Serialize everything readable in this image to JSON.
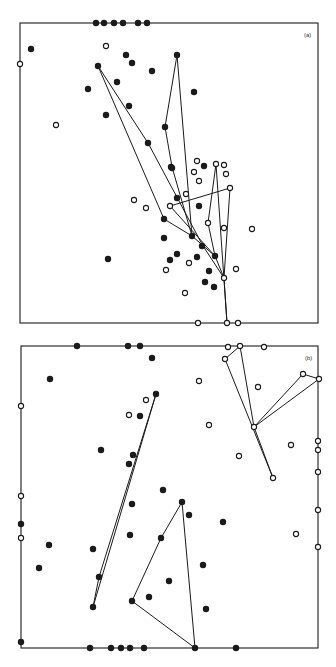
{
  "figure": {
    "width": 336,
    "height": 667,
    "stroke_color": "#1a1a1a",
    "point_radius": 3.2,
    "panels": [
      {
        "id": "a",
        "label": "(a)",
        "label_pos": [
          304,
          38
        ],
        "frame": {
          "x1": 20,
          "y1": 23,
          "x2": 318,
          "y2": 323
        },
        "filled_points": [
          [
            96,
            23
          ],
          [
            104,
            23
          ],
          [
            114,
            23
          ],
          [
            123,
            23
          ],
          [
            138,
            23
          ],
          [
            147,
            23
          ],
          [
            31,
            49
          ],
          [
            126,
            55
          ],
          [
            177,
            55
          ],
          [
            132,
            63
          ],
          [
            98,
            66
          ],
          [
            152,
            71
          ],
          [
            117,
            82
          ],
          [
            88,
            89
          ],
          [
            194,
            92
          ],
          [
            129,
            106
          ],
          [
            106,
            115
          ],
          [
            165,
            127
          ],
          [
            148,
            143
          ],
          [
            172,
            168
          ],
          [
            171,
            167
          ],
          [
            204,
            166
          ],
          [
            177,
            198
          ],
          [
            199,
            206
          ],
          [
            164,
            219
          ],
          [
            164,
            238
          ],
          [
            192,
            236
          ],
          [
            202,
            246
          ],
          [
            108,
            259
          ],
          [
            177,
            254
          ],
          [
            170,
            260
          ],
          [
            197,
            257
          ],
          [
            215,
            256
          ],
          [
            209,
            271
          ],
          [
            205,
            282
          ],
          [
            214,
            287
          ]
        ],
        "open_points": [
          [
            20,
            64
          ],
          [
            106,
            46
          ],
          [
            56,
            125
          ],
          [
            197,
            161
          ],
          [
            216,
            164
          ],
          [
            224,
            165
          ],
          [
            194,
            172
          ],
          [
            226,
            174
          ],
          [
            199,
            181
          ],
          [
            230,
            188
          ],
          [
            186,
            194
          ],
          [
            134,
            200
          ],
          [
            170,
            206
          ],
          [
            146,
            208
          ],
          [
            208,
            223
          ],
          [
            224,
            228
          ],
          [
            252,
            229
          ],
          [
            189,
            263
          ],
          [
            166,
            270
          ],
          [
            236,
            269
          ],
          [
            224,
            278
          ],
          [
            185,
            293
          ],
          [
            198,
            323
          ],
          [
            227,
            323
          ],
          [
            238,
            323
          ]
        ],
        "polylines": [
          [
            [
              98,
              66
            ],
            [
              164,
              219
            ],
            [
              192,
              236
            ],
            [
              215,
              256
            ],
            [
              224,
              278
            ]
          ],
          [
            [
              98,
              66
            ],
            [
              148,
              143
            ],
            [
              203,
              246
            ],
            [
              224,
              278
            ]
          ],
          [
            [
              177,
              55
            ],
            [
              165,
              127
            ],
            [
              172,
              167
            ],
            [
              192,
              236
            ]
          ],
          [
            [
              177,
              55
            ],
            [
              192,
              236
            ]
          ],
          [
            [
              170,
              206
            ],
            [
              230,
              188
            ],
            [
              224,
              278
            ],
            [
              227,
              323
            ]
          ],
          [
            [
              170,
              206
            ],
            [
              215,
              256
            ]
          ],
          [
            [
              216,
              164
            ],
            [
              208,
              223
            ],
            [
              215,
              256
            ]
          ],
          [
            [
              216,
              164
            ],
            [
              227,
              323
            ]
          ]
        ]
      },
      {
        "id": "b",
        "label": "(b)",
        "label_pos": [
          305,
          361
        ],
        "frame": {
          "x1": 21,
          "y1": 346,
          "x2": 318,
          "y2": 648
        },
        "filled_points": [
          [
            77,
            346
          ],
          [
            128,
            346
          ],
          [
            140,
            346
          ],
          [
            152,
            358
          ],
          [
            50,
            379
          ],
          [
            156,
            394
          ],
          [
            140,
            416
          ],
          [
            101,
            450
          ],
          [
            133,
            455
          ],
          [
            129,
            464
          ],
          [
            163,
            490
          ],
          [
            182,
            502
          ],
          [
            132,
            504
          ],
          [
            189,
            515
          ],
          [
            223,
            522
          ],
          [
            21,
            524
          ],
          [
            130,
            535
          ],
          [
            161,
            538
          ],
          [
            49,
            545
          ],
          [
            93,
            549
          ],
          [
            203,
            565
          ],
          [
            39,
            568
          ],
          [
            99,
            577
          ],
          [
            169,
            581
          ],
          [
            149,
            597
          ],
          [
            132,
            601
          ],
          [
            93,
            607
          ],
          [
            206,
            609
          ],
          [
            21,
            642
          ],
          [
            90,
            648
          ],
          [
            111,
            648
          ],
          [
            121,
            648
          ],
          [
            130,
            648
          ],
          [
            144,
            648
          ],
          [
            195,
            648
          ],
          [
            236,
            648
          ]
        ],
        "open_points": [
          [
            228,
            347
          ],
          [
            240,
            346
          ],
          [
            264,
            347
          ],
          [
            225,
            359
          ],
          [
            303,
            374
          ],
          [
            319,
            379
          ],
          [
            199,
            381
          ],
          [
            258,
            387
          ],
          [
            146,
            400
          ],
          [
            129,
            415
          ],
          [
            21,
            406
          ],
          [
            209,
            425
          ],
          [
            254,
            427
          ],
          [
            291,
            445
          ],
          [
            318,
            441
          ],
          [
            318,
            450
          ],
          [
            239,
            456
          ],
          [
            318,
            472
          ],
          [
            273,
            478
          ],
          [
            21,
            496
          ],
          [
            318,
            510
          ],
          [
            296,
            534
          ],
          [
            21,
            538
          ],
          [
            318,
            547
          ]
        ],
        "polylines": [
          [
            [
              156,
              394
            ],
            [
              99,
              577
            ],
            [
              93,
              607
            ]
          ],
          [
            [
              156,
              394
            ],
            [
              93,
              607
            ]
          ],
          [
            [
              182,
              502
            ],
            [
              161,
              538
            ],
            [
              132,
              601
            ],
            [
              195,
              648
            ]
          ],
          [
            [
              182,
              502
            ],
            [
              195,
              648
            ]
          ],
          [
            [
              225,
              359
            ],
            [
              240,
              346
            ],
            [
              254,
              427
            ],
            [
              273,
              478
            ]
          ],
          [
            [
              225,
              359
            ],
            [
              273,
              478
            ]
          ],
          [
            [
              254,
              427
            ],
            [
              303,
              374
            ],
            [
              319,
              379
            ],
            [
              254,
              427
            ]
          ]
        ]
      }
    ]
  }
}
